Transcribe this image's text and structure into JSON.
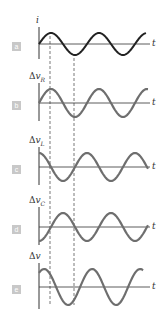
{
  "figure": {
    "panels": [
      {
        "id": "a",
        "label": "a",
        "y_label": "i",
        "y_sub": "",
        "t_label": "t",
        "phase": "sin"
      },
      {
        "id": "b",
        "label": "b",
        "y_label": "Δv",
        "y_sub": "R",
        "t_label": "t",
        "phase": "sin"
      },
      {
        "id": "c",
        "label": "c",
        "y_label": "Δv",
        "y_sub": "L",
        "t_label": "t",
        "phase": "cos"
      },
      {
        "id": "d",
        "label": "d",
        "y_label": "Δv",
        "y_sub": "C",
        "t_label": "t",
        "phase": "-cos"
      },
      {
        "id": "e",
        "label": "e",
        "y_label": "Δv",
        "y_sub": "",
        "t_label": "t",
        "phase": "sin+shift"
      }
    ],
    "colors": {
      "current_curve": "#222222",
      "voltage_curve": "#6e6e6e",
      "axis": "#333333",
      "label_box": "#c8c8c8",
      "dashed_line": "#555555"
    }
  }
}
